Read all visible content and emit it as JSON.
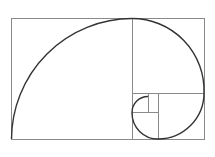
{
  "diagram": {
    "type": "golden-spiral",
    "background": "#ffffff",
    "line_color": "#8a8a8a",
    "spiral_color": "#333333",
    "outer_rect": {
      "x": 11,
      "y": 18,
      "w": 193,
      "h": 121
    },
    "dividers": [
      {
        "x1": 132,
        "y1": 18,
        "x2": 132,
        "y2": 139
      },
      {
        "x1": 132,
        "y1": 93,
        "x2": 204,
        "y2": 93
      },
      {
        "x1": 158,
        "y1": 93,
        "x2": 158,
        "y2": 139
      },
      {
        "x1": 132,
        "y1": 112,
        "x2": 158,
        "y2": 112
      },
      {
        "x1": 148,
        "y1": 93,
        "x2": 148,
        "y2": 112
      }
    ]
  }
}
